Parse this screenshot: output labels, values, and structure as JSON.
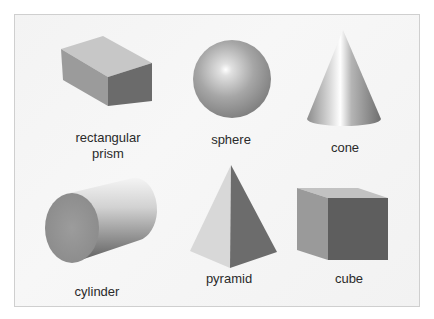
{
  "figure": {
    "title": "",
    "shapes": [
      {
        "id": "rectangular-prism",
        "label_lines": [
          "rectangular",
          "prism"
        ]
      },
      {
        "id": "sphere",
        "label_lines": [
          "sphere"
        ]
      },
      {
        "id": "cone",
        "label_lines": [
          "cone"
        ]
      },
      {
        "id": "cylinder",
        "label_lines": [
          "cylinder"
        ]
      },
      {
        "id": "pyramid",
        "label_lines": [
          "pyramid"
        ]
      },
      {
        "id": "cube",
        "label_lines": [
          "cube"
        ]
      }
    ]
  },
  "colors": {
    "background": "#ffffff",
    "panel": "#f4f4f4",
    "panel_border": "#cfcfcf",
    "light_face": "#c4c4c4",
    "mid_face": "#9a9a9a",
    "dark_face": "#6a6a6a",
    "text": "#2a2a2a"
  }
}
